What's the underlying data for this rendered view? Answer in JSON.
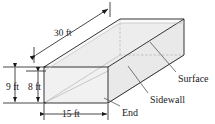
{
  "figure": {
    "shape": "rectangular-prism-channel",
    "colors": {
      "outline": "#2b2b2b",
      "hidden_line": "#9a9a9a",
      "dimension_line": "#1a1a1a",
      "leader_line": "#555555",
      "face_front": "#f1f1f1",
      "face_sidewall": "#e9e9e9",
      "face_top_inner": "#fbfbfb",
      "face_water": "#ededed",
      "background": "#ffffff"
    },
    "dimensions": [
      {
        "id": "length",
        "label": "30 ft",
        "value": 30,
        "unit": "ft",
        "orientation": "diagonal-depth"
      },
      {
        "id": "wall_height",
        "label": "9 ft",
        "value": 9,
        "unit": "ft",
        "orientation": "vertical-outer"
      },
      {
        "id": "water_depth",
        "label": "8 ft",
        "value": 8,
        "unit": "ft",
        "orientation": "vertical-inner"
      },
      {
        "id": "width",
        "label": "15 ft",
        "value": 15,
        "unit": "ft",
        "orientation": "horizontal"
      }
    ],
    "callouts": [
      {
        "id": "surface",
        "label": "Surface",
        "points_to": "water-surface-plane"
      },
      {
        "id": "sidewall",
        "label": "Sidewall",
        "points_to": "right-side-wall-face"
      },
      {
        "id": "end",
        "label": "End",
        "points_to": "near-end-face"
      }
    ],
    "geometry": {
      "front_face": {
        "left": 44,
        "top": 67,
        "right": 108,
        "bottom": 103
      },
      "depth_vector": {
        "dx": 76,
        "dy": -48
      }
    }
  }
}
